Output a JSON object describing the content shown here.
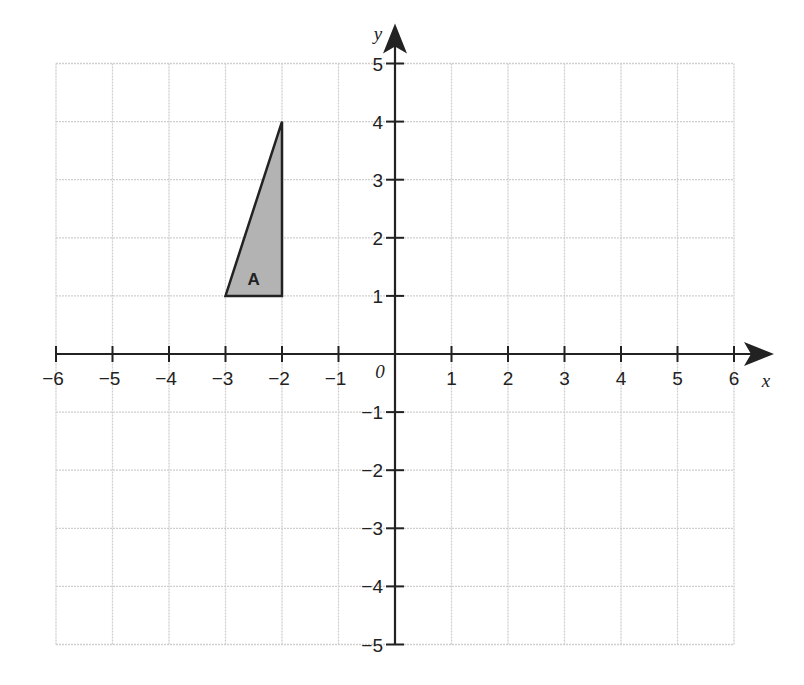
{
  "diagram": {
    "type": "coordinate-grid",
    "x_axis": {
      "label": "x",
      "min": -6,
      "max": 6,
      "tick_labels": [
        "-6",
        "-5",
        "-4",
        "-3",
        "-2",
        "-1",
        "1",
        "2",
        "3",
        "4",
        "5",
        "6"
      ]
    },
    "y_axis": {
      "label": "y",
      "min": -5,
      "max": 5,
      "tick_labels": [
        "5",
        "4",
        "3",
        "2",
        "1",
        "-1",
        "-2",
        "-3",
        "-4",
        "-5"
      ]
    },
    "origin_label": "0",
    "grid": true,
    "shapes": [
      {
        "name": "A",
        "type": "triangle",
        "vertices": [
          [
            -3,
            1
          ],
          [
            -2,
            1
          ],
          [
            -2,
            4
          ]
        ],
        "fill": "#b3b3b3",
        "stroke": "#222222"
      }
    ]
  }
}
